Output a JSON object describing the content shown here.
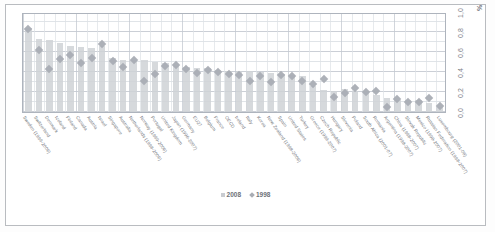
{
  "axis": {
    "unit_symbol": "%",
    "y_ticks": [
      "0,0",
      "0,2",
      "0,4",
      "0,6",
      "0,8",
      "1,0"
    ],
    "ylim": [
      0,
      1.0
    ]
  },
  "legend": {
    "items": [
      {
        "label": "2008",
        "marker": "bar",
        "color": "#c9ccd1"
      },
      {
        "label": "1998",
        "marker": "diamond",
        "color": "#a9adb4"
      }
    ]
  },
  "chart_data": {
    "type": "bar",
    "title": "",
    "xlabel": "",
    "ylabel": "%",
    "ylim": [
      0,
      1.0
    ],
    "grid": true,
    "legend_position": "bottom",
    "categories": [
      "Sweden (1999-2006)",
      "Switzerland",
      "Denmark",
      "Iceland",
      "Finland",
      "Canada",
      "Austria",
      "Israel",
      "Singapore",
      "Australia",
      "Netherlands (1998-2006)",
      "Norway (1999-2006)",
      "Portugal",
      "United Kingdom",
      "Japan (1996-2007)",
      "Germany",
      "EU27",
      "Belgium",
      "France",
      "OECD",
      "Ireland",
      "Italy",
      "Korea",
      "New Zealand (1998-2006)",
      "Spain",
      "United States",
      "Turkey",
      "Greece (1999-2007)",
      "Czech Republic",
      "Hungary",
      "Slovenia",
      "Poland",
      "South Africa (2001-07)",
      "Romania",
      "Argentina (1998-2007)",
      "China (1998-2007)",
      "Slovak Republic",
      "Mexico (1998-2007)",
      "Russian Federation (1998-2007)",
      "Luxembourg (2001-08)"
    ],
    "series": [
      {
        "name": "2008",
        "type": "bar",
        "color": "#cfd2d6",
        "values": [
          0.84,
          0.73,
          0.72,
          0.69,
          0.66,
          0.65,
          0.64,
          0.66,
          0.54,
          0.52,
          0.52,
          0.52,
          0.5,
          0.49,
          0.46,
          0.45,
          0.44,
          0.44,
          0.42,
          0.41,
          0.41,
          0.41,
          0.4,
          0.39,
          0.38,
          0.37,
          0.36,
          0.26,
          0.22,
          0.21,
          0.23,
          0.21,
          0.21,
          0.17,
          0.14,
          0.12,
          0.12,
          0.12,
          0.09,
          0.05
        ]
      },
      {
        "name": "1998",
        "type": "scatter",
        "color": "#a9adb4",
        "values": [
          0.83,
          0.62,
          0.43,
          0.53,
          0.57,
          0.49,
          0.54,
          0.68,
          0.51,
          0.45,
          0.52,
          0.31,
          0.38,
          0.46,
          0.47,
          0.43,
          0.39,
          0.42,
          0.4,
          0.38,
          0.37,
          0.31,
          0.36,
          0.3,
          0.37,
          0.36,
          0.31,
          0.28,
          0.33,
          0.15,
          0.19,
          0.24,
          0.2,
          0.21,
          0.05,
          0.13,
          0.1,
          0.1,
          0.14,
          0.06
        ]
      }
    ]
  }
}
